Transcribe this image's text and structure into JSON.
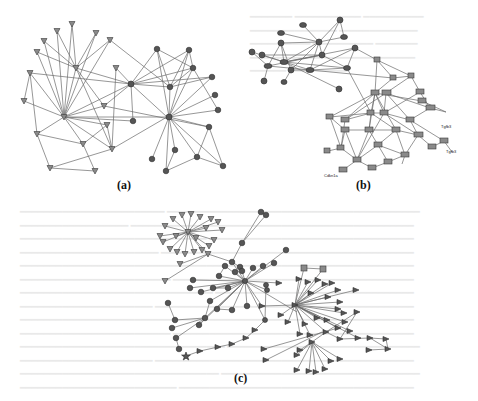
{
  "figure": {
    "subfigures": [
      {
        "id": "a",
        "caption": "(a)",
        "node_shapes": [
          "inverted-triangle",
          "circle"
        ]
      },
      {
        "id": "b",
        "caption": "(b)",
        "node_shapes": [
          "circle",
          "rectangle-labeled"
        ],
        "visible_labels": [
          "Tgfb3",
          "Tgfb3",
          "Cdkn1a"
        ]
      },
      {
        "id": "c",
        "caption": "(c)",
        "node_shapes": [
          "inverted-triangle",
          "circle",
          "square",
          "flag",
          "star"
        ]
      }
    ]
  },
  "colors": {
    "edge": "#6a6a6a",
    "node_fill": "#555555",
    "node_light_fill": "#8a8a8a",
    "background": "#ffffff",
    "bleed_text": "#e9e9e9"
  }
}
